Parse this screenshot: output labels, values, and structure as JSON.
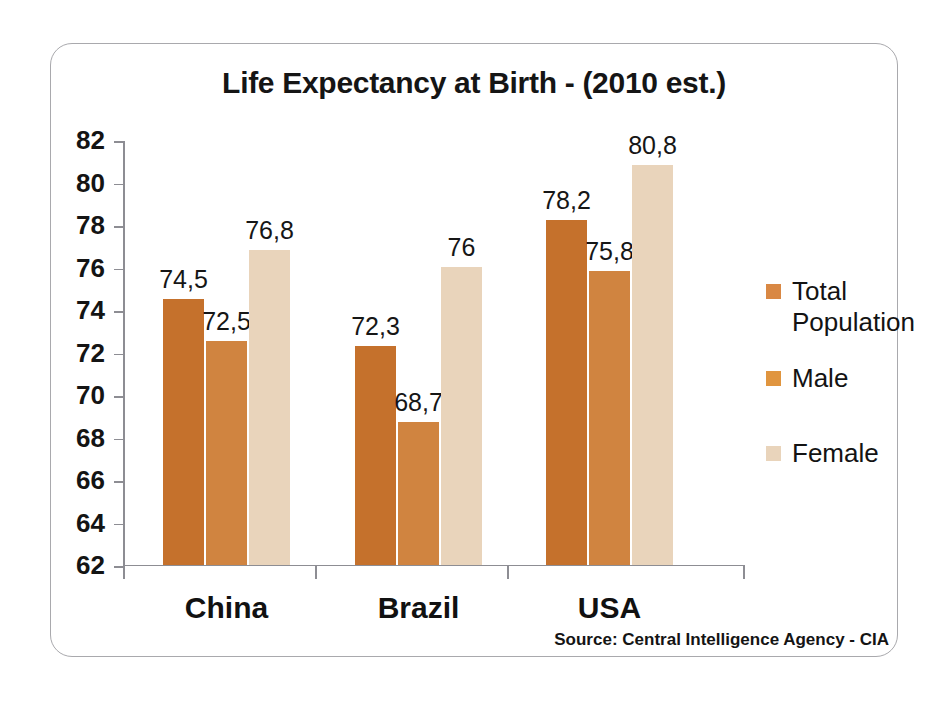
{
  "chart_data": {
    "type": "bar",
    "title": "Life Expectancy at Birth - (2010 est.)",
    "categories": [
      "China",
      "Brazil",
      "USA"
    ],
    "series": [
      {
        "name": "Total Population",
        "color": "#c5712c",
        "values": [
          74.5,
          72.5,
          78.2
        ],
        "labels": [
          "74,5",
          "72,3",
          "78,2"
        ]
      },
      {
        "name": "Male",
        "color": "#d08440",
        "values": [
          72.5,
          68.7,
          75.8
        ],
        "labels": [
          "72,5",
          "68,7",
          "75,8"
        ]
      },
      {
        "name": "Female",
        "color": "#e9d4bb",
        "values": [
          76.8,
          76.0,
          80.8
        ],
        "labels": [
          "76,8",
          "76",
          "80,8"
        ]
      }
    ],
    "groups": [
      {
        "category": "China",
        "bars": [
          {
            "series": "Total Population",
            "value": 74.5,
            "label": "74,5"
          },
          {
            "series": "Male",
            "value": 72.5,
            "label": "72,5"
          },
          {
            "series": "Female",
            "value": 76.8,
            "label": "76,8"
          }
        ]
      },
      {
        "category": "Brazil",
        "bars": [
          {
            "series": "Total Population",
            "value": 72.3,
            "label": "72,3"
          },
          {
            "series": "Male",
            "value": 68.7,
            "label": "68,7"
          },
          {
            "series": "Female",
            "value": 76.0,
            "label": "76"
          }
        ]
      },
      {
        "category": "USA",
        "bars": [
          {
            "series": "Total Population",
            "value": 78.2,
            "label": "78,2"
          },
          {
            "series": "Male",
            "value": 75.8,
            "label": "75,8"
          },
          {
            "series": "Female",
            "value": 80.8,
            "label": "80,8"
          }
        ]
      }
    ],
    "ylim": [
      62,
      82
    ],
    "ytick_values": [
      82,
      80,
      78,
      76,
      74,
      72,
      70,
      68,
      66,
      64,
      62
    ],
    "ytick_labels": [
      "82",
      "80",
      "78",
      "76",
      "74",
      "72",
      "70",
      "68",
      "66",
      "64",
      "62"
    ],
    "xlabel": "",
    "ylabel": "",
    "grid": false,
    "legend_position": "right",
    "legend": [
      "Total Population",
      "Male",
      "Female"
    ],
    "source": "Source: Central Intelligence Agency - CIA"
  },
  "colors": {
    "total": "#c5712c",
    "male": "#d08440",
    "female": "#e9d4bb",
    "axis": "#8d8d93",
    "text": "#141414",
    "card_border": "#a9a9ad",
    "background": "#ffffff"
  }
}
